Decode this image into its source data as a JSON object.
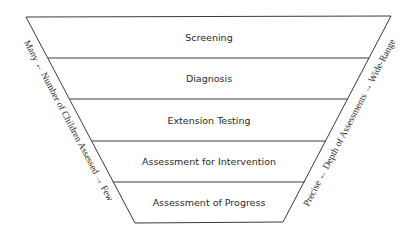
{
  "diagram": {
    "type": "inverted-funnel",
    "levels": [
      {
        "label": "Screening"
      },
      {
        "label": "Diagnosis"
      },
      {
        "label": "Extension Testing"
      },
      {
        "label": "Assessment for Intervention"
      },
      {
        "label": "Assessment of Progress"
      }
    ],
    "left_axis": {
      "text": "Many ← Number of Children Assessed → Few"
    },
    "right_axis": {
      "text": "Precise ← Depth of Assessments → Wide-Range"
    },
    "colors": {
      "line": "#3a3a3a",
      "text": "#2a2a2a",
      "background": "#ffffff"
    }
  }
}
